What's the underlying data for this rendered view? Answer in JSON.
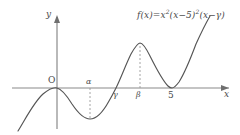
{
  "figure": {
    "type": "function-graph",
    "background_color": "#ffffff",
    "ink_color": "#4a4a4a",
    "curve_color": "#555555"
  },
  "axes": {
    "y_label": "y",
    "x_label": "x",
    "origin_label": "O",
    "origin_px": {
      "x": 57,
      "y": 88
    },
    "x_axis_y_px": 88,
    "y_axis_x_px": 57,
    "x_axis_arrow": "right",
    "y_axis_arrow": "up"
  },
  "formula": {
    "lhs": "f(x)",
    "equals": "=",
    "base1": "x",
    "exp1": "2",
    "factor2_open": "(x−5)",
    "exp2": "2",
    "factor3": "(x−γ)",
    "full_text": "f(x)=x²(x−5)²(x−γ)"
  },
  "tick_labels": {
    "alpha": "α",
    "gamma": "γ",
    "beta": "β",
    "five": "5"
  },
  "guides": [
    {
      "name": "alpha-guide",
      "label": "α",
      "x_px": 90,
      "from_y_px": 88,
      "to_y_px": 119,
      "style": "dashed",
      "direction": "down-to-local-minimum"
    },
    {
      "name": "beta-guide",
      "label": "β",
      "x_px": 140,
      "from_y_px": 88,
      "to_y_px": 43,
      "style": "dashed",
      "direction": "up-to-local-maximum"
    }
  ],
  "chart_data": {
    "type": "line",
    "title": "",
    "xlabel": "x",
    "ylabel": "y",
    "grid": false,
    "legend": null,
    "annotations": [
      "f(x)=x²(x−5)²(x−γ)",
      "O",
      "α",
      "γ",
      "β",
      "5"
    ],
    "roots": [
      {
        "label": "0",
        "multiplicity": 2,
        "x_px": 57,
        "type": "tangent-touch"
      },
      {
        "label": "γ",
        "multiplicity": 1,
        "x_px": 116,
        "type": "crossing"
      },
      {
        "label": "5",
        "multiplicity": 2,
        "x_px": 172,
        "type": "tangent-touch"
      }
    ],
    "critical_points": [
      {
        "label": "α",
        "kind": "local-minimum",
        "x_px": 90,
        "y_px": 119
      },
      {
        "label": "γ",
        "kind": "crossing",
        "x_px": 116,
        "y_px": 88
      },
      {
        "label": "β",
        "kind": "local-maximum",
        "x_px": 140,
        "y_px": 43
      },
      {
        "label": "5",
        "kind": "local-minimum",
        "x_px": 172,
        "y_px": 88
      }
    ],
    "ordering_note": "0 < α < γ < β < 5",
    "curve_path_px": "M 18,131 C 26,118 34,102 43,94 C 49,89 54,87 57,88 C 62,89 67,96 72,104 C 78,113 84,119 90,119 C 97,119 103,112 109,101 C 112,96 114,92 116,88 C 121,78 126,64 131,54 C 135,47 138,43 140,43 C 143,43 146,48 150,56 C 156,68 162,80 168,86 C 170,88 171,88 172,88 C 174,88 176,86 179,82 C 184,74 190,60 196,44 C 201,33 206,23 210,16"
  }
}
